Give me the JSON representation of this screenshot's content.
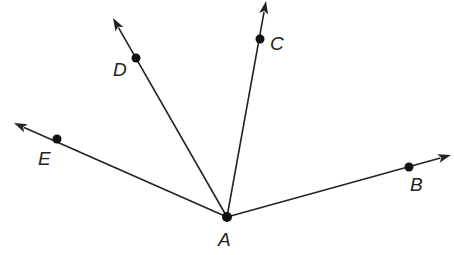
{
  "diagram": {
    "type": "rays-from-common-vertex",
    "vertex": {
      "label": "A",
      "x": 227,
      "y": 217,
      "label_x": 218,
      "label_y": 246
    },
    "rays": [
      {
        "name": "ray-AB",
        "point": {
          "label": "B",
          "x": 409,
          "y": 167,
          "label_x": 410,
          "label_y": 191
        },
        "tip": {
          "x": 451,
          "y": 155
        }
      },
      {
        "name": "ray-AC",
        "point": {
          "label": "C",
          "x": 260,
          "y": 39,
          "label_x": 270,
          "label_y": 50
        },
        "tip": {
          "x": 266,
          "y": 1
        }
      },
      {
        "name": "ray-AD",
        "point": {
          "label": "D",
          "x": 136,
          "y": 58,
          "label_x": 113,
          "label_y": 76
        },
        "tip": {
          "x": 113,
          "y": 18
        }
      },
      {
        "name": "ray-AE",
        "point": {
          "label": "E",
          "x": 57,
          "y": 139,
          "label_x": 38,
          "label_y": 165
        },
        "tip": {
          "x": 14,
          "y": 123
        }
      }
    ],
    "colors": {
      "line": "#222222",
      "point": "#111111",
      "background": "#ffffff"
    }
  }
}
